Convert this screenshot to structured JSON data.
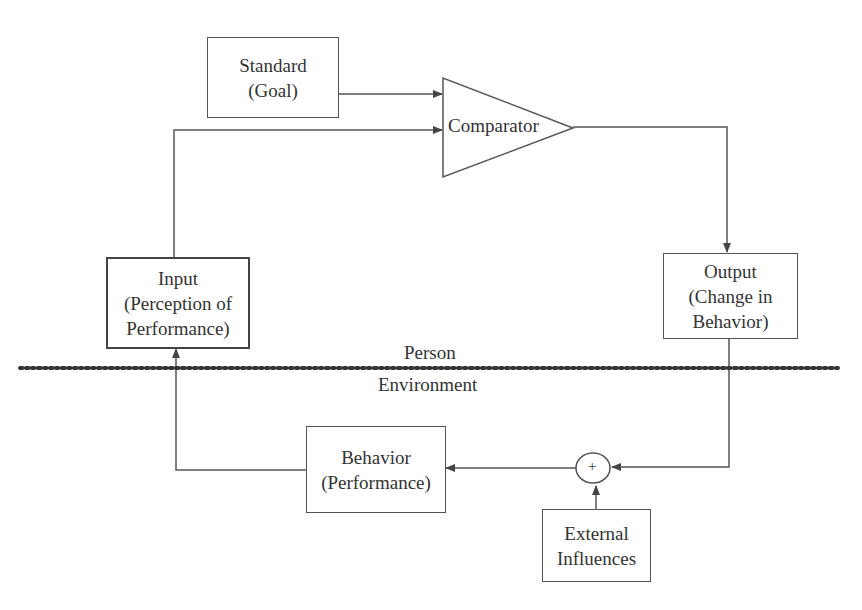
{
  "diagram": {
    "type": "feedback-control-loop",
    "nodes": {
      "standard": {
        "line1": "Standard",
        "line2": "(Goal)"
      },
      "comparator": {
        "label": "Comparator"
      },
      "input": {
        "line1": "Input",
        "line2": "(Perception of",
        "line3": "Performance)"
      },
      "output": {
        "line1": "Output",
        "line2": "(Change in",
        "line3": "Behavior)"
      },
      "behavior": {
        "line1": "Behavior",
        "line2": "(Performance)"
      },
      "summing_junction": {
        "symbol": "+"
      },
      "external": {
        "line1": "External",
        "line2": "Influences"
      }
    },
    "regions": {
      "upper": "Person",
      "lower": "Environment"
    },
    "edges": [
      {
        "from": "standard",
        "to": "comparator"
      },
      {
        "from": "input",
        "to": "comparator"
      },
      {
        "from": "comparator",
        "to": "output"
      },
      {
        "from": "output",
        "to": "summing_junction"
      },
      {
        "from": "external",
        "to": "summing_junction"
      },
      {
        "from": "summing_junction",
        "to": "behavior"
      },
      {
        "from": "behavior",
        "to": "input"
      }
    ],
    "colors": {
      "stroke": "#555555",
      "text": "#333333",
      "background": "#ffffff"
    }
  }
}
